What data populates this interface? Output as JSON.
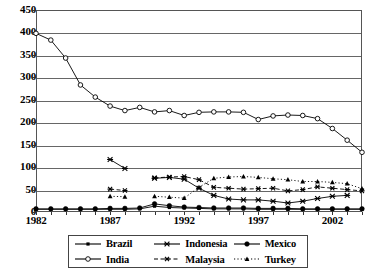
{
  "chart_data": {
    "type": "line",
    "title": "",
    "xlabel": "",
    "ylabel": "",
    "ylim": [
      0,
      450
    ],
    "xlim": [
      1982,
      2004
    ],
    "grid": true,
    "legend_position": "bottom",
    "y_ticks": [
      450,
      400,
      350,
      300,
      250,
      200,
      150,
      100,
      50,
      0
    ],
    "x_ticks": [
      1982,
      1987,
      1992,
      1997,
      2002
    ],
    "x": [
      1982,
      1983,
      1984,
      1985,
      1986,
      1987,
      1988,
      1989,
      1990,
      1991,
      1992,
      1993,
      1994,
      1995,
      1996,
      1997,
      1998,
      1999,
      2000,
      2001,
      2002,
      2003,
      2004
    ],
    "series": [
      {
        "name": "India",
        "marker": "open-circle",
        "line": "solid",
        "values": [
          398,
          383,
          343,
          283,
          256,
          236,
          226,
          233,
          223,
          226,
          215,
          222,
          223,
          223,
          222,
          206,
          214,
          216,
          215,
          208,
          186,
          160,
          133
        ]
      },
      {
        "name": "Indonesia",
        "marker": "x",
        "line": "solid",
        "values": [
          null,
          null,
          null,
          null,
          null,
          117,
          97,
          null,
          75,
          77,
          73,
          53,
          37,
          29,
          27,
          27,
          24,
          20,
          24,
          30,
          35,
          37,
          null
        ]
      },
      {
        "name": "Malaysia",
        "marker": "asterisk",
        "line": "dashed",
        "values": [
          null,
          null,
          null,
          null,
          null,
          51,
          48,
          null,
          76,
          78,
          79,
          72,
          55,
          53,
          51,
          52,
          53,
          47,
          50,
          56,
          53,
          50,
          47
        ]
      },
      {
        "name": "Turkey",
        "marker": "triangle",
        "line": "dotted",
        "values": [
          null,
          null,
          null,
          null,
          null,
          35,
          34,
          null,
          35,
          33,
          31,
          55,
          75,
          78,
          79,
          77,
          74,
          72,
          68,
          68,
          66,
          63,
          52
        ]
      },
      {
        "name": "Mexico",
        "marker": "filled-circle",
        "line": "solid",
        "values": [
          7,
          7,
          7,
          7,
          7,
          8,
          8,
          9,
          18,
          14,
          11,
          10,
          9,
          9,
          9,
          8,
          8,
          8,
          7,
          7,
          7,
          7,
          7
        ]
      },
      {
        "name": "Brazil",
        "marker": "filled-diamond",
        "line": "solid",
        "values": [
          6,
          6,
          6,
          6,
          6,
          6,
          6,
          7,
          13,
          10,
          9,
          8,
          7,
          7,
          7,
          6,
          6,
          6,
          6,
          6,
          6,
          6,
          6
        ]
      }
    ]
  },
  "axis": {
    "y_labels": [
      "450",
      "400",
      "350",
      "300",
      "250",
      "200",
      "150",
      "100",
      "50",
      "0"
    ],
    "x_labels": [
      "1982",
      "1987",
      "1992",
      "1997",
      "2002"
    ]
  },
  "legend": {
    "items": [
      {
        "label": "Brazil",
        "marker": "filled-diamond",
        "line": "solid"
      },
      {
        "label": "India",
        "marker": "open-circle",
        "line": "solid"
      },
      {
        "label": "Indonesia",
        "marker": "x",
        "line": "solid"
      },
      {
        "label": "Malaysia",
        "marker": "asterisk",
        "line": "dashed"
      },
      {
        "label": "Mexico",
        "marker": "filled-circle",
        "line": "solid"
      },
      {
        "label": "Turkey",
        "marker": "triangle",
        "line": "dotted"
      }
    ]
  },
  "colors": {
    "ink": "#000000",
    "grid": "#666666",
    "frame": "#555555",
    "background": "#ffffff"
  }
}
